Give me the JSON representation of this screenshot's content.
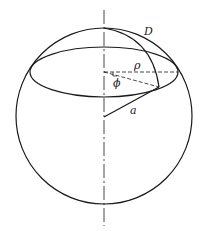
{
  "figure": {
    "labels": {
      "D": "D",
      "rho": "ρ",
      "phi": "ϕ",
      "a": "a"
    },
    "colors": {
      "stroke": "#1a1a1a",
      "background": "#ffffff"
    }
  }
}
